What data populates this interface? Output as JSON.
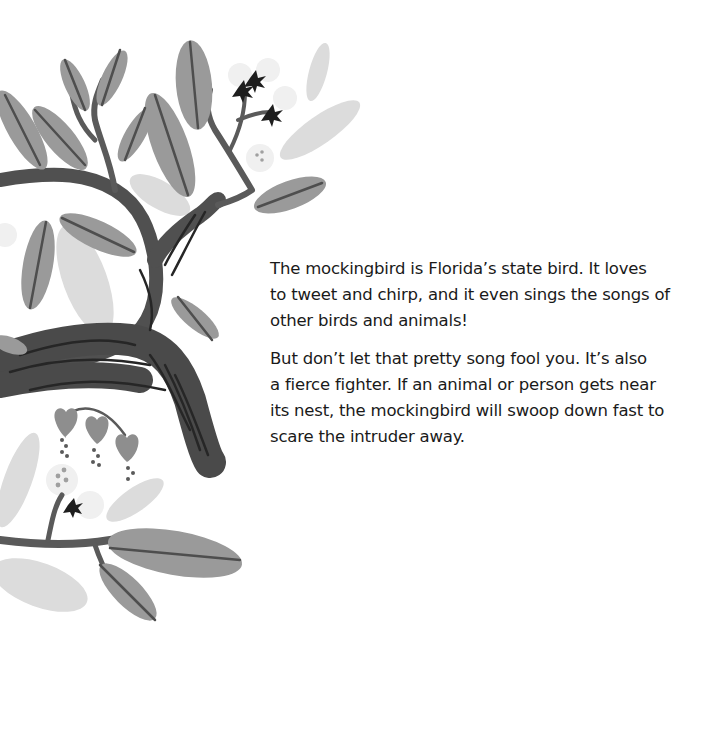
{
  "illustration": {
    "subject": "stylized grayscale tree branch with leaves, buds and flowers",
    "colors": {
      "branch": "#4a4a4a",
      "branch_stripe": "#2a2a2a",
      "leaf_dark": "#8a8a8a",
      "leaf_mid": "#a8a8a8",
      "leaf_light": "#d4d4d4",
      "leaf_vein": "#555555",
      "flower_pale": "#eeeeee",
      "bud_dark": "#1e1e1e"
    }
  },
  "text": {
    "paragraphs": [
      {
        "lines": [
          "The mockingbird is Florida’s state bird. It loves",
          "to tweet and chirp, and it even sings the songs of",
          "other birds and animals!"
        ]
      },
      {
        "lines": [
          "But don’t let that pretty song fool you. It’s also",
          "a fierce fighter. If an animal or person gets near",
          "its nest, the mockingbird will swoop down fast to",
          "scare the intruder away."
        ]
      }
    ]
  }
}
